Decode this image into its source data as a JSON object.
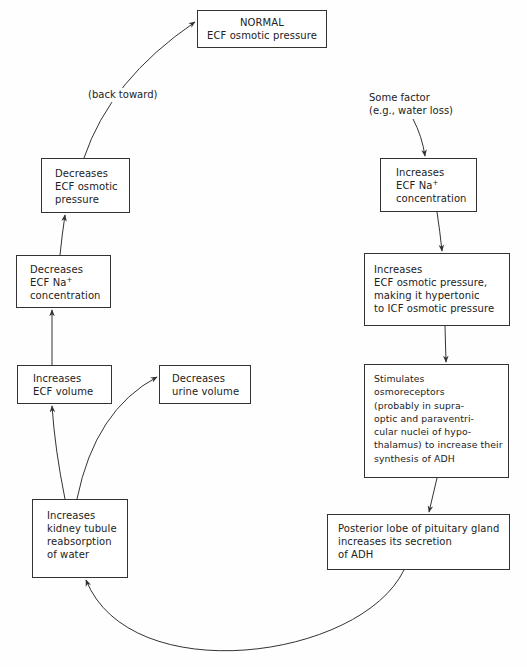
{
  "nodes": {
    "normal": {
      "lines": [
        "NORMAL",
        "ECF osmotic pressure"
      ]
    },
    "trigger": {
      "lines": [
        "Some factor",
        "(e.g., water loss)"
      ]
    },
    "inc_na": {
      "lines": [
        "Increases",
        "ECF Na",
        "concentration"
      ],
      "sup": "+"
    },
    "inc_osm": {
      "lines": [
        "Increases",
        "ECF osmotic pressure,",
        "making it hypertonic",
        "to ICF osmotic pressure"
      ]
    },
    "stim": {
      "lines": [
        "Stimulates",
        "osmoreceptors",
        "(probably in supra-",
        "optic and paraventri-",
        "cular nuclei of hypo-",
        "thalamus)  to increase their",
        "synthesis of ADH"
      ]
    },
    "pituitary": {
      "lines": [
        "Posterior lobe of pituitary gland",
        "increases its secretion",
        "of ADH"
      ]
    },
    "kidney": {
      "lines": [
        "Increases",
        "kidney tubule",
        "reabsorption",
        "of water"
      ]
    },
    "urine": {
      "lines": [
        "Decreases",
        "urine volume"
      ]
    },
    "ecf_vol": {
      "lines": [
        "Increases",
        "ECF volume"
      ]
    },
    "dec_na": {
      "lines": [
        "Decreases",
        "ECF Na",
        "concentration"
      ],
      "sup": "+"
    },
    "dec_osm": {
      "lines": [
        "Decreases",
        "ECF osmotic",
        "pressure"
      ]
    }
  },
  "edge_labels": {
    "back_toward": "(back toward)"
  },
  "colors": {
    "line": "#333333",
    "background": "#fefefe"
  }
}
